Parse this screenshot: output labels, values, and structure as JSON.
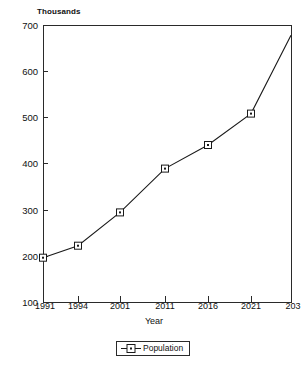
{
  "chart_data": {
    "type": "line",
    "title": "",
    "subtitle": "",
    "unit_label": "Thousands",
    "xlabel": "Year",
    "ylabel": "",
    "categories": [
      "1991",
      "1994",
      "2001",
      "2011",
      "2016",
      "2021",
      "2031"
    ],
    "x_tick_labels": [
      "1991",
      "1994",
      "2001",
      "2011",
      "2016",
      "2021",
      "203"
    ],
    "y_tick_labels": [
      "100",
      "200",
      "300",
      "400",
      "500",
      "600",
      "700"
    ],
    "y_ticks": [
      100,
      200,
      300,
      400,
      500,
      600,
      700
    ],
    "ylim": [
      100,
      700
    ],
    "grid": false,
    "legend_position": "bottom",
    "marker": "square-dot",
    "line_color": "#1a1a1a",
    "series": [
      {
        "name": "Population",
        "values": [
          196,
          222,
          294,
          389,
          440,
          508,
          678
        ]
      }
    ],
    "annotations": []
  },
  "legend": {
    "entries": [
      {
        "label": "Population",
        "marker": "square-dot-marker"
      }
    ]
  },
  "axis": {
    "x_title": "Year",
    "y_unit": "Thousands"
  }
}
